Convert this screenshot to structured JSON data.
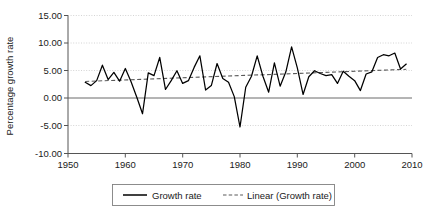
{
  "chart_data": {
    "type": "line",
    "title": "",
    "xlabel": "",
    "ylabel": "Percentage growth rate",
    "xlim": [
      1950,
      2010
    ],
    "ylim": [
      -10.0,
      15.0
    ],
    "xticks": [
      1950,
      1960,
      1970,
      1980,
      1990,
      2000,
      2010
    ],
    "xticklabels": [
      "1950",
      "1960",
      "1970",
      "1980",
      "1990",
      "2000",
      "2010"
    ],
    "yticks": [
      -10.0,
      -5.0,
      0.0,
      5.0,
      10.0,
      15.0
    ],
    "yticklabels": [
      "-10.00",
      "-5.00",
      "0.00",
      "5.00",
      "10.00",
      "15.00"
    ],
    "grid": "horizontal-dotted",
    "legend_position": "bottom-center",
    "legend": [
      {
        "label": "Growth rate",
        "style": "solid",
        "color": "#000000"
      },
      {
        "label": "Linear (Growth rate)",
        "style": "dashed",
        "color": "#5a5a5a"
      }
    ],
    "series": [
      {
        "name": "Growth rate",
        "style": "solid",
        "x": [
          1953,
          1954,
          1955,
          1956,
          1957,
          1958,
          1959,
          1960,
          1961,
          1962,
          1963,
          1964,
          1965,
          1966,
          1967,
          1968,
          1969,
          1970,
          1971,
          1972,
          1973,
          1974,
          1975,
          1976,
          1977,
          1978,
          1979,
          1980,
          1981,
          1982,
          1983,
          1984,
          1985,
          1986,
          1987,
          1988,
          1989,
          1990,
          1991,
          1992,
          1993,
          1994,
          1995,
          1996,
          1997,
          1998,
          1999,
          2000,
          2001,
          2002,
          2003,
          2004,
          2005,
          2006,
          2007,
          2008,
          2009
        ],
        "values": [
          2.9,
          2.3,
          3.2,
          6.0,
          3.4,
          4.7,
          3.1,
          5.4,
          3.0,
          0.2,
          -2.8,
          4.6,
          4.1,
          7.4,
          1.6,
          3.2,
          5.0,
          2.7,
          3.2,
          5.6,
          7.7,
          1.5,
          2.3,
          6.3,
          3.6,
          2.9,
          0.3,
          -5.2,
          2.0,
          4.0,
          7.7,
          4.0,
          1.1,
          6.4,
          2.2,
          4.8,
          9.3,
          5.5,
          0.7,
          3.9,
          5.0,
          4.5,
          4.1,
          4.3,
          2.7,
          4.9,
          4.0,
          3.2,
          1.4,
          4.4,
          4.8,
          7.4,
          7.9,
          7.7,
          8.2,
          5.3,
          6.2
        ]
      },
      {
        "name": "Linear (Growth rate)",
        "style": "dashed",
        "description": "linear trend fitted to Growth rate",
        "x": [
          1953,
          2009
        ],
        "values": [
          3.05,
          5.25
        ]
      }
    ]
  },
  "axes": {
    "y_title": "Percentage growth rate"
  }
}
